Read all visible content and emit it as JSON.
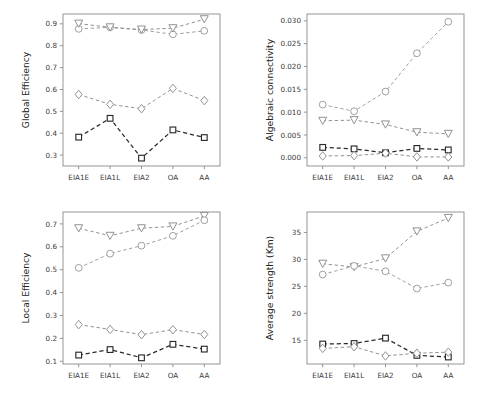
{
  "figure": {
    "layout": "2x2 grid of line plots",
    "background": "#ffffff",
    "categories": [
      "EIA1E",
      "EIA1L",
      "EIA2",
      "OA",
      "AA"
    ],
    "marker_shapes": [
      "circle",
      "triangle-down",
      "diamond",
      "square"
    ],
    "series_colors": {
      "circle": "#9a9a9a",
      "triangle-down": "#8c8c8c",
      "diamond": "#8c8c8c",
      "square": "#2b2b2b"
    }
  },
  "chart_data": [
    {
      "id": "global-efficiency",
      "position": "top-left",
      "type": "line",
      "title": "",
      "xlabel": "",
      "ylabel": "Global Efficiency",
      "categories": [
        "EIA1E",
        "EIA1L",
        "EIA2",
        "OA",
        "AA"
      ],
      "yticks": [
        0.3,
        0.4,
        0.5,
        0.6,
        0.7,
        0.8,
        0.9
      ],
      "ytick_labels": [
        "0.3",
        "0.4",
        "0.5",
        "0.6",
        "0.7",
        "0.8",
        "0.9"
      ],
      "ylim": [
        0.25,
        0.945
      ],
      "grid": false,
      "legend": "none",
      "series": [
        {
          "name": "circle",
          "marker": "circle",
          "color": "#9a9a9a",
          "linestyle": "dashed",
          "values": [
            0.877,
            0.884,
            0.872,
            0.852,
            0.868
          ]
        },
        {
          "name": "triangle-down",
          "marker": "triangle-down",
          "color": "#8c8c8c",
          "linestyle": "dashed",
          "values": [
            0.901,
            0.884,
            0.874,
            0.88,
            0.921
          ]
        },
        {
          "name": "diamond",
          "marker": "diamond",
          "color": "#8c8c8c",
          "linestyle": "dashed",
          "values": [
            0.577,
            0.532,
            0.512,
            0.605,
            0.549
          ]
        },
        {
          "name": "square",
          "marker": "square",
          "color": "#2b2b2b",
          "linestyle": "dashed",
          "values": [
            0.382,
            0.468,
            0.286,
            0.415,
            0.38
          ]
        }
      ]
    },
    {
      "id": "algebraic-connectivity",
      "position": "top-right",
      "type": "line",
      "title": "",
      "xlabel": "",
      "ylabel": "Algebraic connectivity",
      "categories": [
        "EIA1E",
        "EIA1L",
        "EIA2",
        "OA",
        "AA"
      ],
      "yticks": [
        0.0,
        0.005,
        0.01,
        0.015,
        0.02,
        0.025,
        0.03
      ],
      "ytick_labels": [
        "0.000",
        "0.005",
        "0.010",
        "0.015",
        "0.020",
        "0.025",
        "0.030"
      ],
      "ylim": [
        -0.0018,
        0.0315
      ],
      "grid": false,
      "legend": "none",
      "series": [
        {
          "name": "circle",
          "marker": "circle",
          "color": "#9a9a9a",
          "linestyle": "dashed",
          "values": [
            0.01165,
            0.0102,
            0.0145,
            0.0229,
            0.0298
          ]
        },
        {
          "name": "triangle-down",
          "marker": "triangle-down",
          "color": "#8c8c8c",
          "linestyle": "dashed",
          "values": [
            0.0081,
            0.00825,
            0.0073,
            0.0056,
            0.00525
          ]
        },
        {
          "name": "square",
          "marker": "square",
          "color": "#2b2b2b",
          "linestyle": "dashed",
          "values": [
            0.00228,
            0.00195,
            0.0011,
            0.00205,
            0.00172
          ]
        },
        {
          "name": "diamond",
          "marker": "diamond",
          "color": "#8c8c8c",
          "linestyle": "dashed",
          "values": [
            0.0004,
            0.00048,
            0.001,
            0.0002,
            0.00018
          ]
        }
      ]
    },
    {
      "id": "local-efficiency",
      "position": "bottom-left",
      "type": "line",
      "title": "",
      "xlabel": "",
      "ylabel": "Local Efficiency",
      "categories": [
        "EIA1E",
        "EIA1L",
        "EIA2",
        "OA",
        "AA"
      ],
      "yticks": [
        0.1,
        0.2,
        0.3,
        0.4,
        0.5,
        0.6,
        0.7
      ],
      "ytick_labels": [
        "0.1",
        "0.2",
        "0.3",
        "0.4",
        "0.5",
        "0.6",
        "0.7"
      ],
      "ylim": [
        0.088,
        0.752
      ],
      "grid": false,
      "legend": "none",
      "series": [
        {
          "name": "triangle-down",
          "marker": "triangle-down",
          "color": "#8c8c8c",
          "linestyle": "dashed",
          "values": [
            0.681,
            0.648,
            0.681,
            0.689,
            0.735
          ]
        },
        {
          "name": "circle",
          "marker": "circle",
          "color": "#9a9a9a",
          "linestyle": "dashed",
          "values": [
            0.508,
            0.57,
            0.605,
            0.648,
            0.716
          ]
        },
        {
          "name": "diamond",
          "marker": "diamond",
          "color": "#8c8c8c",
          "linestyle": "dashed",
          "values": [
            0.26,
            0.239,
            0.216,
            0.238,
            0.217
          ]
        },
        {
          "name": "square",
          "marker": "square",
          "color": "#2b2b2b",
          "linestyle": "dashed",
          "values": [
            0.127,
            0.151,
            0.115,
            0.174,
            0.153
          ]
        }
      ]
    },
    {
      "id": "average-strength",
      "position": "bottom-right",
      "type": "line",
      "title": "",
      "xlabel": "",
      "ylabel": "Average strength (Km)",
      "categories": [
        "EIA1E",
        "EIA1L",
        "EIA2",
        "OA",
        "AA"
      ],
      "yticks": [
        15,
        20,
        25,
        30,
        35
      ],
      "ytick_labels": [
        "15",
        "20",
        "25",
        "30",
        "35"
      ],
      "ylim": [
        10.6,
        38.8
      ],
      "grid": false,
      "legend": "none",
      "series": [
        {
          "name": "triangle-down",
          "marker": "triangle-down",
          "color": "#8c8c8c",
          "linestyle": "dashed",
          "values": [
            29.2,
            28.6,
            30.2,
            35.2,
            37.7
          ]
        },
        {
          "name": "circle",
          "marker": "circle",
          "color": "#9a9a9a",
          "linestyle": "dashed",
          "values": [
            27.2,
            28.8,
            27.8,
            24.6,
            25.7
          ]
        },
        {
          "name": "square",
          "marker": "square",
          "color": "#2b2b2b",
          "linestyle": "dashed",
          "values": [
            14.3,
            14.4,
            15.4,
            12.2,
            11.9
          ]
        },
        {
          "name": "diamond",
          "marker": "diamond",
          "color": "#8c8c8c",
          "linestyle": "dashed",
          "values": [
            13.5,
            13.8,
            12.1,
            12.6,
            12.8
          ]
        }
      ]
    }
  ]
}
